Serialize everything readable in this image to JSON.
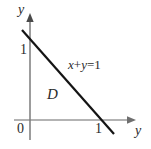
{
  "figure": {
    "type": "math-diagram",
    "background_color": "#ffffff",
    "axes": {
      "vertical": {
        "label": "y",
        "color": "#777777",
        "arrow": "up",
        "x_px": 30,
        "from_y_px": 14,
        "to_y_px": 140
      },
      "horizontal": {
        "label": "y",
        "color": "#999999",
        "arrow": "right",
        "y_px": 120,
        "from_x_px": 14,
        "to_x_px": 136
      }
    },
    "ticks": {
      "origin": "0",
      "y_axis_one": "1",
      "x_axis_one": "1"
    },
    "line": {
      "equation": "x+y=1",
      "equation_lhs_x": "x",
      "equation_plus": "+",
      "equation_lhs_y": "y",
      "equation_eq": "=",
      "equation_rhs": "1",
      "color": "#1a1a1a",
      "width_px": 2,
      "from_px": [
        22,
        30
      ],
      "to_px": [
        114,
        134
      ]
    },
    "region": {
      "label": "D"
    }
  }
}
